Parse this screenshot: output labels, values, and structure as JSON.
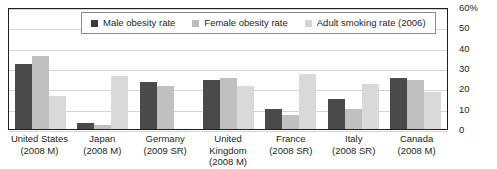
{
  "chart_data": {
    "type": "bar",
    "title": "",
    "xlabel": "",
    "ylabel": "",
    "ylim": [
      0,
      60
    ],
    "yticks": [
      "60%",
      "50",
      "40",
      "30",
      "20",
      "10",
      "0"
    ],
    "ytick_values": [
      60,
      50,
      40,
      30,
      20,
      10,
      0
    ],
    "grid": true,
    "legend_position": "top-center",
    "categories": [
      "United States (2008 M)",
      "Japan (2008 M)",
      "Germany (2009 SR)",
      "United Kingdom (2008 M)",
      "France (2008 SR)",
      "Italy (2008 SR)",
      "Canada (2008 M)"
    ],
    "category_lines": [
      {
        "line1": "United States",
        "line2": "(2008 M)"
      },
      {
        "line1": "Japan",
        "line2": "(2008 M)"
      },
      {
        "line1": "Germany",
        "line2": "(2009 SR)"
      },
      {
        "line1": "United Kingdom",
        "line2": "(2008 M)"
      },
      {
        "line1": "France",
        "line2": "(2008 SR)"
      },
      {
        "line1": "Italy",
        "line2": "(2008 SR)"
      },
      {
        "line1": "Canada",
        "line2": "(2008 M)"
      }
    ],
    "series": [
      {
        "name": "Male obesity rate",
        "color": "#4a4a4a",
        "values": [
          32,
          3,
          23,
          24,
          10,
          15,
          25
        ]
      },
      {
        "name": "Female obesity rate",
        "color": "#c0c0c0",
        "values": [
          36,
          2,
          21,
          25,
          7,
          10,
          24
        ]
      },
      {
        "name": "Adult smoking rate (2006)",
        "color": "#d9d9d9",
        "values": [
          16,
          26,
          0,
          21,
          27,
          22,
          18
        ]
      }
    ]
  },
  "legend": {
    "items": [
      {
        "label": "Male obesity rate"
      },
      {
        "label": "Female obesity rate"
      },
      {
        "label": "Adult smoking rate (2006)"
      }
    ]
  }
}
